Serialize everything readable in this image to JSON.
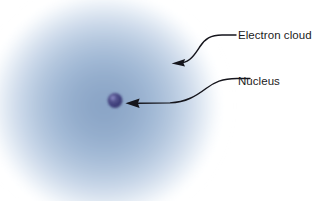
{
  "figure": {
    "type": "diagram",
    "background_color": "#ffffff",
    "width": 335,
    "height": 201
  },
  "diagram_data": {
    "type": "labeled-illustration",
    "title": "",
    "parts": [
      {
        "id": "electron-cloud",
        "label": "Electron cloud",
        "shape": "radial-gradient-sphere",
        "center": [
          105,
          105
        ],
        "radius": 118,
        "core_color": "#8aa4c6",
        "mid_color": "#b9cade",
        "edge_color": "#ffffff"
      },
      {
        "id": "nucleus",
        "label": "Nucleus",
        "shape": "small-sphere",
        "center": [
          115,
          100
        ],
        "radius": 7.5,
        "core_color": "#3c3c78",
        "highlight_color": "#6f6fae"
      }
    ],
    "leader_lines": [
      {
        "id": "leader-electron-cloud",
        "target": "electron-cloud",
        "tail": [
          224,
          35
        ],
        "head": [
          172,
          63
        ],
        "style": "s-curve",
        "color": "#15151c"
      },
      {
        "id": "leader-nucleus",
        "target": "nucleus",
        "tail": [
          238,
          78
        ],
        "head": [
          126,
          103
        ],
        "style": "s-curve",
        "color": "#15151c"
      }
    ]
  },
  "labels": {
    "electron_cloud": "Electron cloud",
    "nucleus": "Nucleus"
  },
  "colors": {
    "text": "#1b1b22",
    "leader_line": "#15151c",
    "cloud_core": "#8aa4c6",
    "nucleus_core": "#3c3c78",
    "background": "#ffffff"
  }
}
